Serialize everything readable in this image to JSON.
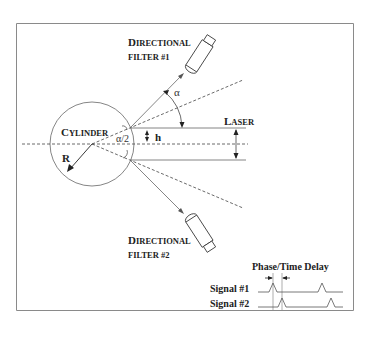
{
  "labels": {
    "filter1_line1_cap": "D",
    "filter1_line1_rest": "IRECTIONAL",
    "filter1_line2": "FILTER #1",
    "filter2_line1_cap": "D",
    "filter2_line1_rest": "IRECTIONAL",
    "filter2_line2": "FILTER #2",
    "cylinder_cap": "C",
    "cylinder_rest": "YLINDER",
    "laser_cap": "L",
    "laser_rest": "ASER",
    "alpha": "α",
    "half_alpha": "α/2",
    "h": "h",
    "radius": "R",
    "phase_delay": "Phase/Time Delay",
    "signal1": "Signal #1",
    "signal2": "Signal #2"
  },
  "colors": {
    "line": "#555555",
    "text": "#222222",
    "frame": "#888888"
  }
}
